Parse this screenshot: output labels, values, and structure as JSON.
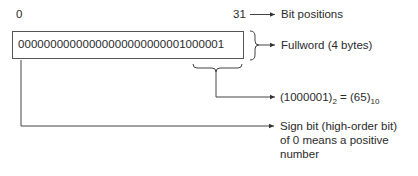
{
  "diagram": {
    "bit_start_label": "0",
    "bit_end_label": "31",
    "bit_positions_label": "Bit positions",
    "fullword_value": "00000000000000000000000001000001",
    "fullword_label": "Fullword (4 bytes)",
    "binary_value": "(1000001)",
    "binary_base": "2",
    "equals": "=",
    "decimal_value": "(65)",
    "decimal_base": "10",
    "sign_bit_line1": "Sign bit (high-order bit)",
    "sign_bit_line2": "of 0 means a positive",
    "sign_bit_line3": "number"
  }
}
